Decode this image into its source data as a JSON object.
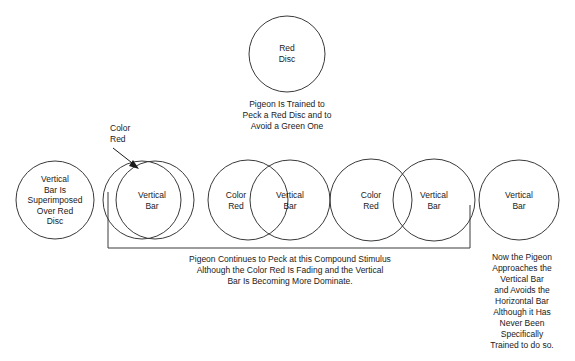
{
  "figure": {
    "background_color": "#ffffff",
    "stroke_color": "#3a3a3a",
    "text_color": "#1a1a1a"
  },
  "top_stage": {
    "circle_label": "Red\nDisc",
    "caption": "Pigeon Is Trained to\nPeck a Red Disc and to\nAvoid a Green One"
  },
  "annotations": {
    "color_red_pointer": "Color\nRed"
  },
  "stages": [
    {
      "name": "stage-1-superimposed",
      "labels": [
        "Vertical\nBar Is\nSuperimposed\nOver Red\nDisc"
      ]
    },
    {
      "name": "stage-2-near-identical",
      "labels": [
        "Vertical\nBar"
      ]
    },
    {
      "name": "stage-3-high-overlap",
      "labels": [
        "Color\nRed",
        "Vertical\nBar"
      ]
    },
    {
      "name": "stage-4-partial-overlap",
      "labels": [
        "Color\nRed",
        "Vertical\nBar"
      ]
    },
    {
      "name": "stage-5-vertical-bar-only",
      "labels": [
        "Vertical\nBar"
      ]
    }
  ],
  "bottom_caption": "Pigeon Continues to Peck at this Compound Stimulus\nAlthough the Color Red  Is Fading and the Vertical\nBar Is Becoming More Dominate.",
  "right_caption": "Now the Pigeon\nApproaches the\nVertical Bar\nand Avoids the\nHorizontal Bar\nAlthough it Has\nNever Been\nSpecifically\nTrained to do so."
}
